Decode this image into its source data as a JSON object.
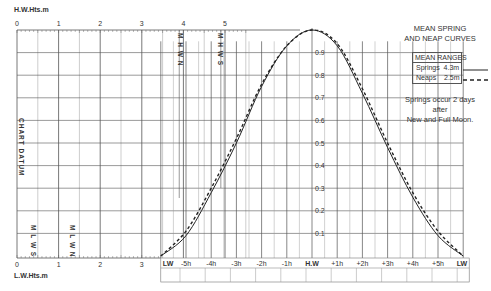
{
  "chart_data": {
    "type": "line",
    "title": "MEAN SPRING AND NEAP CURVES",
    "hw_axis": {
      "label": "H.W.Hts.m",
      "ticks": [
        "0",
        "1",
        "2",
        "3",
        "4",
        "5"
      ]
    },
    "lw_axis": {
      "label": "L.W.Hts.m",
      "ticks": [
        "0",
        "1",
        "2",
        "3"
      ]
    },
    "factor_ticks": [
      "0.9",
      "0.8",
      "0.7",
      "0.6",
      "0.5",
      "0.4",
      "0.3",
      "0.2",
      "0.1"
    ],
    "time_ticks": [
      "LW",
      "-5h",
      "-4h",
      "-3h",
      "-2h",
      "-1h",
      "H.W",
      "+1h",
      "+2h",
      "+3h",
      "+4h",
      "+5h",
      "LW"
    ],
    "x": [
      -6,
      -5,
      -4,
      -3,
      -2,
      -1,
      0,
      1,
      2,
      3,
      4,
      5,
      6
    ],
    "series": [
      {
        "name": "Springs",
        "style": "solid",
        "values": [
          0.0,
          0.09,
          0.28,
          0.5,
          0.75,
          0.93,
          1.0,
          0.93,
          0.72,
          0.48,
          0.26,
          0.09,
          0.0
        ]
      },
      {
        "name": "Neaps",
        "style": "dashed",
        "values": [
          0.0,
          0.11,
          0.3,
          0.52,
          0.76,
          0.93,
          1.0,
          0.94,
          0.74,
          0.5,
          0.28,
          0.11,
          0.0
        ]
      }
    ],
    "vertical_markers": [
      {
        "label": "M H W N",
        "axis": "HW",
        "value": 3.9
      },
      {
        "label": "M H W S",
        "axis": "HW",
        "value": 4.9
      },
      {
        "label": "M L W S",
        "axis": "LW",
        "value": 0.5
      },
      {
        "label": "M L W N",
        "axis": "LW",
        "value": 1.4
      }
    ],
    "side_label": "CHART DATUM",
    "legend": {
      "title": "MEAN RANGES",
      "entries": [
        {
          "name": "Springs",
          "value": "4.3m",
          "style": "solid"
        },
        {
          "name": "Neaps",
          "value": "2.5m",
          "style": "dashed"
        }
      ]
    },
    "note": "Springs occur 2 days after New and Full Moon.",
    "grid": true
  },
  "labels": {
    "title_line1": "MEAN SPRING",
    "title_line2": "AND NEAP CURVES",
    "legend_title": "MEAN RANGES",
    "springs": "Springs  4.3m",
    "neaps": "Neaps    2.5m",
    "note_line1": "Springs occur 2 days",
    "note_line2": "after",
    "note_line3": "New and Full Moon.",
    "hw_axis": "H.W.Hts.m",
    "lw_axis": "L.W.Hts.m",
    "chart_datum": "CHART DATUM",
    "mhwn": "M H W N",
    "mhws": "M H W S",
    "mlws": "M L W S",
    "mlwn": "M L W N"
  },
  "colors": {
    "line": "#222222",
    "grid": "#9a9a9a",
    "grid_dark": "#555555"
  }
}
